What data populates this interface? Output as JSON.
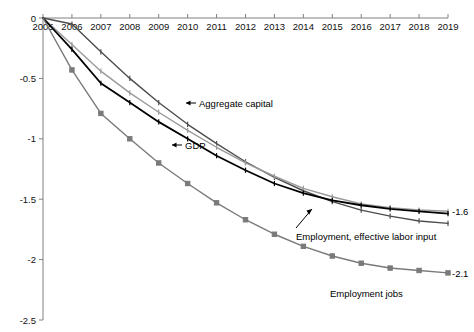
{
  "chart_data": {
    "type": "line",
    "title": "",
    "subtitle": "",
    "xlabel": "",
    "ylabel": "",
    "grid": false,
    "legend_position": "inline-annotations",
    "x": [
      2005,
      2006,
      2007,
      2008,
      2009,
      2010,
      2011,
      2012,
      2013,
      2014,
      2015,
      2016,
      2017,
      2018,
      2019
    ],
    "categories": [
      "2005",
      "2006",
      "2007",
      "2008",
      "2009",
      "2010",
      "2011",
      "2012",
      "2013",
      "2014",
      "2015",
      "2016",
      "2017",
      "2018",
      "2019"
    ],
    "xtick_labels": [
      "2005",
      "2006",
      "2007",
      "2008",
      "2009",
      "2010",
      "2011",
      "2012",
      "2013",
      "2014",
      "2015",
      "2016",
      "2017",
      "2018",
      "2019"
    ],
    "ytick_labels": [
      "0",
      "-0.5",
      "-1",
      "-1.5",
      "-2",
      "-2.5"
    ],
    "ytick_values": [
      0,
      -0.5,
      -1,
      -1.5,
      -2,
      -2.5
    ],
    "xlim": [
      2005,
      2019
    ],
    "ylim": [
      -2.5,
      0
    ],
    "series": [
      {
        "name": "Aggregate capital",
        "color": "#4d4d4d",
        "marker": "tick",
        "values": [
          0,
          -0.05,
          -0.28,
          -0.5,
          -0.7,
          -0.88,
          -1.04,
          -1.19,
          -1.32,
          -1.43,
          -1.52,
          -1.59,
          -1.64,
          -1.68,
          -1.7
        ]
      },
      {
        "name": "GDP",
        "color": "#9a9a9a",
        "marker": "tick",
        "values": [
          0,
          -0.22,
          -0.44,
          -0.62,
          -0.78,
          -0.93,
          -1.07,
          -1.2,
          -1.31,
          -1.41,
          -1.48,
          -1.54,
          -1.57,
          -1.59,
          -1.6
        ]
      },
      {
        "name": "Employment, effective labor input",
        "color": "#000000",
        "marker": "tick",
        "values": [
          0,
          -0.26,
          -0.54,
          -0.7,
          -0.86,
          -1.0,
          -1.14,
          -1.26,
          -1.37,
          -1.45,
          -1.51,
          -1.55,
          -1.58,
          -1.6,
          -1.62
        ]
      },
      {
        "name": "Employment jobs",
        "color": "#7a7a7a",
        "marker": "square",
        "values": [
          0,
          -0.43,
          -0.79,
          -1.0,
          -1.2,
          -1.37,
          -1.53,
          -1.67,
          -1.79,
          -1.89,
          -1.97,
          -2.03,
          -2.07,
          -2.09,
          -2.11
        ]
      }
    ],
    "annotations": [
      {
        "name": "aggregate-capital",
        "text": "Aggregate capital",
        "arrow": "left"
      },
      {
        "name": "gdp",
        "text": "GDP",
        "arrow": "left"
      },
      {
        "name": "employment-effective-labor-input",
        "text": "Employment, effective labor input",
        "arrow": "leader"
      },
      {
        "name": "employment-jobs",
        "text": "Employment jobs",
        "arrow": "none"
      }
    ],
    "end_labels": [
      {
        "name": "converged-value",
        "text": "-1.6",
        "value": -1.6
      },
      {
        "name": "employment-jobs-value",
        "text": "-2.1",
        "value": -2.1
      }
    ]
  }
}
